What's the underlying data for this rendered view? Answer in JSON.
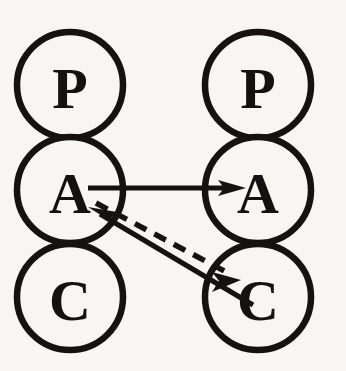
{
  "diagram": {
    "background_color": "#f7f6f3",
    "ink_color": "#15120f",
    "columns": [
      {
        "name": "left-agent",
        "center_x": 70,
        "nodes": [
          {
            "id": "left-p",
            "label": "P",
            "cy": 85,
            "r": 53
          },
          {
            "id": "left-a",
            "label": "A",
            "cy": 190,
            "r": 53
          },
          {
            "id": "left-c",
            "label": "C",
            "cy": 297,
            "r": 53
          }
        ]
      },
      {
        "name": "right-agent",
        "center_x": 258,
        "nodes": [
          {
            "id": "right-p",
            "label": "P",
            "cy": 85,
            "r": 53
          },
          {
            "id": "right-a",
            "label": "A",
            "cy": 190,
            "r": 53
          },
          {
            "id": "right-c",
            "label": "C",
            "cy": 297,
            "r": 53
          }
        ]
      }
    ],
    "links": [
      {
        "id": "left-a-to-right-a",
        "from": "left-a",
        "to": "right-a",
        "style": "solid",
        "arrow": "end",
        "x1": 88,
        "y1": 188,
        "x2": 246,
        "y2": 188
      },
      {
        "id": "left-a-to-right-c",
        "from": "left-a",
        "to": "right-c",
        "style": "dashed",
        "arrow": "end",
        "x1": 96,
        "y1": 203,
        "x2": 239,
        "y2": 279
      },
      {
        "id": "right-c-to-left-a",
        "from": "right-c",
        "to": "left-a",
        "style": "solid",
        "arrow": "end",
        "x1": 253,
        "y1": 305,
        "x2": 88,
        "y2": 207
      }
    ]
  }
}
